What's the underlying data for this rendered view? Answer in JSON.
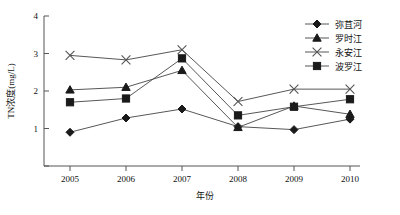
{
  "chart_data": {
    "type": "line",
    "title": "",
    "xlabel": "年份",
    "ylabel": "TN浓度(mg/L)",
    "categories": [
      "2005",
      "2006",
      "2007",
      "2008",
      "2009",
      "2010"
    ],
    "x_tick_labels": [
      "2005",
      "2006",
      "2007",
      "2008",
      "2009",
      "2010"
    ],
    "y_tick_labels": [
      "0",
      "1",
      "2",
      "3",
      "4"
    ],
    "ylim": [
      0,
      4
    ],
    "xlim": [
      2005,
      2010
    ],
    "grid": false,
    "legend_position": "top-right",
    "series": [
      {
        "name": "弥苴河",
        "marker": "diamond",
        "values": [
          0.9,
          1.28,
          1.52,
          1.05,
          0.97,
          1.25
        ]
      },
      {
        "name": "罗时江",
        "marker": "triangle",
        "values": [
          2.03,
          2.1,
          2.55,
          1.03,
          1.6,
          1.38
        ]
      },
      {
        "name": "永安江",
        "marker": "cross",
        "values": [
          2.95,
          2.83,
          3.1,
          1.72,
          2.05,
          2.05
        ]
      },
      {
        "name": "波罗江",
        "marker": "square",
        "values": [
          1.7,
          1.8,
          2.87,
          1.35,
          1.58,
          1.78
        ]
      }
    ]
  },
  "legend": {
    "entries": [
      {
        "label": "弥苴河",
        "marker": "diamond"
      },
      {
        "label": "罗时江",
        "marker": "triangle"
      },
      {
        "label": "永安江",
        "marker": "cross"
      },
      {
        "label": "波罗江",
        "marker": "square"
      }
    ]
  },
  "axes": {
    "y_title": "TN浓度(mg/L)",
    "x_title": "年份"
  }
}
